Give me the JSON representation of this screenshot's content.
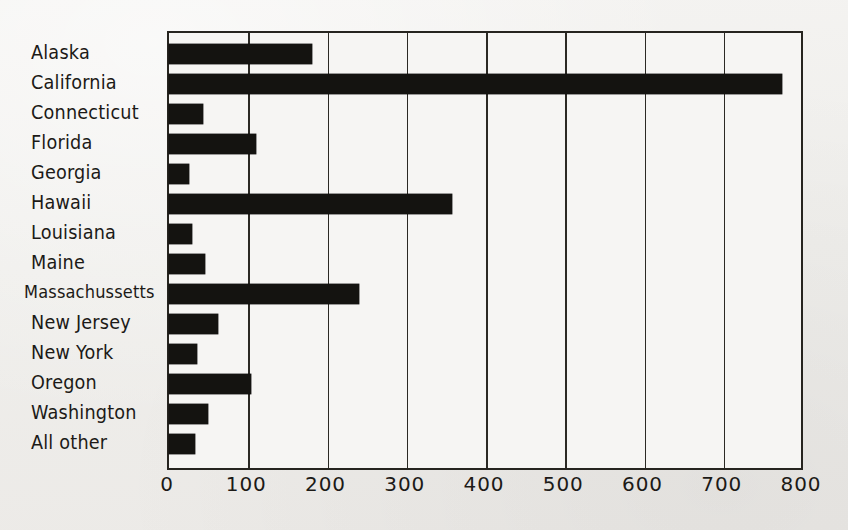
{
  "chart_data": {
    "type": "bar",
    "orientation": "horizontal",
    "title": "",
    "subtitle": "",
    "xlabel": "",
    "ylabel": "",
    "xlim": [
      0,
      800
    ],
    "ylim": null,
    "grid": true,
    "grid_axis": "x",
    "legend": null,
    "legend_position": "none",
    "xticks": [
      0,
      100,
      200,
      300,
      400,
      500,
      600,
      700,
      800
    ],
    "xticklabels": [
      "0",
      "100",
      "200",
      "300",
      "400",
      "500",
      "600",
      "700",
      "800"
    ],
    "categories": [
      "Alaska",
      "California",
      "Connecticut",
      "Florida",
      "Georgia",
      "Hawaii",
      "Louisiana",
      "Maine",
      "Massachussetts",
      "New Jersey",
      "New York",
      "Oregon",
      "Washington",
      "All other"
    ],
    "values": [
      180,
      773,
      43,
      110,
      25,
      357,
      29,
      45,
      240,
      62,
      35,
      104,
      49,
      33
    ],
    "series": [
      {
        "name": "",
        "values": [
          180,
          773,
          43,
          110,
          25,
          357,
          29,
          45,
          240,
          62,
          35,
          104,
          49,
          33
        ]
      }
    ],
    "annotations": []
  },
  "style": {
    "bar_color": "#141310",
    "axis_color": "#26241f",
    "grid_color": "#2b2924",
    "background_color": "#f1f0ee",
    "plot_background_color": "#f6f5f3",
    "text_color": "#1c1a17"
  }
}
